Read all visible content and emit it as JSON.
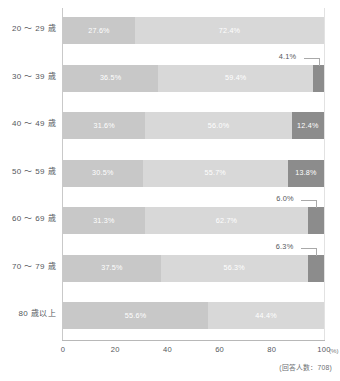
{
  "chart_data": {
    "type": "bar",
    "subtype": "stacked-horizontal-100",
    "title": "",
    "xlabel": "",
    "ylabel": "",
    "xlim": [
      0,
      100
    ],
    "grid": false,
    "legend": "none",
    "unit": "(%)",
    "categories": [
      "20 ～ 29 歳",
      "30 ～ 39 歳",
      "40 ～ 49 歳",
      "50 ～ 59 歳",
      "60 ～ 69 歳",
      "70 ～ 79 歳",
      "80 歳以上"
    ],
    "series": [
      {
        "name": "segment-1",
        "color": "#c8c8c8",
        "values": [
          27.6,
          36.5,
          31.6,
          30.5,
          31.3,
          37.5,
          55.6
        ]
      },
      {
        "name": "segment-2",
        "color": "#d8d8d8",
        "values": [
          72.4,
          59.4,
          56.0,
          55.7,
          62.7,
          56.3,
          44.4
        ]
      },
      {
        "name": "segment-3",
        "color": "#8c8c8c",
        "values": [
          0.0,
          4.1,
          12.4,
          13.8,
          6.0,
          6.3,
          0.0
        ]
      }
    ],
    "ticks": [
      "0",
      "20",
      "40",
      "60",
      "80",
      "100"
    ],
    "tick_values": [
      0,
      20,
      40,
      60,
      80,
      100
    ],
    "footnote": "(回答人数：708)",
    "respondents": 708
  },
  "rows": [
    {
      "label": "20 ～ 29 歳",
      "segments": [
        {
          "value": 27.6,
          "text": "27.6%",
          "color": "#c8c8c8",
          "inside": true
        },
        {
          "value": 72.4,
          "text": "72.4%",
          "color": "#d8d8d8",
          "inside": true
        },
        {
          "value": 0.0,
          "text": "",
          "color": "#8c8c8c",
          "inside": true
        }
      ],
      "callout": ""
    },
    {
      "label": "30 ～ 39 歳",
      "segments": [
        {
          "value": 36.5,
          "text": "36.5%",
          "color": "#c8c8c8",
          "inside": true
        },
        {
          "value": 59.4,
          "text": "59.4%",
          "color": "#d8d8d8",
          "inside": true
        },
        {
          "value": 4.1,
          "text": "",
          "color": "#8c8c8c",
          "inside": false
        }
      ],
      "callout": "4.1%"
    },
    {
      "label": "40 ～ 49 歳",
      "segments": [
        {
          "value": 31.6,
          "text": "31.6%",
          "color": "#c8c8c8",
          "inside": true
        },
        {
          "value": 56.0,
          "text": "56.0%",
          "color": "#d8d8d8",
          "inside": true
        },
        {
          "value": 12.4,
          "text": "12.4%",
          "color": "#8c8c8c",
          "inside": true
        }
      ],
      "callout": ""
    },
    {
      "label": "50 ～ 59 歳",
      "segments": [
        {
          "value": 30.5,
          "text": "30.5%",
          "color": "#c8c8c8",
          "inside": true
        },
        {
          "value": 55.7,
          "text": "55.7%",
          "color": "#d8d8d8",
          "inside": true
        },
        {
          "value": 13.8,
          "text": "13.8%",
          "color": "#8c8c8c",
          "inside": true
        }
      ],
      "callout": ""
    },
    {
      "label": "60 ～ 69 歳",
      "segments": [
        {
          "value": 31.3,
          "text": "31.3%",
          "color": "#c8c8c8",
          "inside": true
        },
        {
          "value": 62.7,
          "text": "62.7%",
          "color": "#d8d8d8",
          "inside": true
        },
        {
          "value": 6.0,
          "text": "",
          "color": "#8c8c8c",
          "inside": false
        }
      ],
      "callout": "6.0%"
    },
    {
      "label": "70 ～ 79 歳",
      "segments": [
        {
          "value": 37.5,
          "text": "37.5%",
          "color": "#c8c8c8",
          "inside": true
        },
        {
          "value": 56.3,
          "text": "56.3%",
          "color": "#d8d8d8",
          "inside": true
        },
        {
          "value": 6.3,
          "text": "",
          "color": "#8c8c8c",
          "inside": false
        }
      ],
      "callout": "6.3%"
    },
    {
      "label": "80 歳以上",
      "segments": [
        {
          "value": 55.6,
          "text": "55.6%",
          "color": "#c8c8c8",
          "inside": true
        },
        {
          "value": 44.4,
          "text": "44.4%",
          "color": "#d8d8d8",
          "inside": true
        },
        {
          "value": 0.0,
          "text": "",
          "color": "#8c8c8c",
          "inside": true
        }
      ],
      "callout": ""
    }
  ],
  "axis": {
    "ticks": [
      "0",
      "20",
      "40",
      "60",
      "80",
      "100"
    ],
    "unit": "(%)"
  },
  "footnote": "(回答人数：708)"
}
